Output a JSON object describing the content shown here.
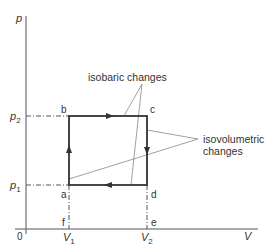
{
  "diagram": {
    "axes": {
      "y_label": "p",
      "x_label": "V",
      "origin_label": "0"
    },
    "ticks": {
      "p2": {
        "base": "p",
        "sub": "2"
      },
      "p1": {
        "base": "p",
        "sub": "1"
      },
      "V1": {
        "base": "V",
        "sub": "1"
      },
      "V2": {
        "base": "V",
        "sub": "2"
      }
    },
    "points": {
      "a": "a",
      "b": "b",
      "c": "c",
      "d": "d",
      "e": "e",
      "f": "f"
    },
    "annotations": {
      "isobaric": "isobaric changes",
      "isovolumetric_line1": "isovolumetric",
      "isovolumetric_line2": "changes"
    },
    "cycle_direction": [
      "a→b (up)",
      "b→c (right)",
      "c→d (down)",
      "d→a (left)"
    ],
    "colors": {
      "axis": "#555555",
      "cycle": "#333333",
      "pointer": "#888888",
      "text": "#333333"
    }
  }
}
